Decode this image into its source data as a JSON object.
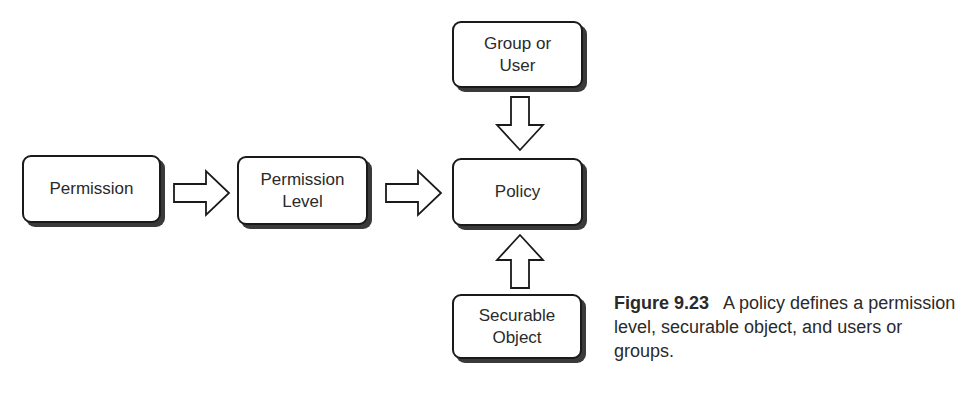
{
  "diagram": {
    "nodes": [
      {
        "id": "group-or-user",
        "label_lines": [
          "Group or",
          "User"
        ]
      },
      {
        "id": "permission",
        "label_lines": [
          "Permission"
        ]
      },
      {
        "id": "permission-level",
        "label_lines": [
          "Permission",
          "Level"
        ]
      },
      {
        "id": "policy",
        "label_lines": [
          "Policy"
        ]
      },
      {
        "id": "securable-object",
        "label_lines": [
          "Securable",
          "Object"
        ]
      }
    ],
    "edges": [
      {
        "from": "permission",
        "to": "permission-level",
        "direction": "right"
      },
      {
        "from": "permission-level",
        "to": "policy",
        "direction": "right"
      },
      {
        "from": "group-or-user",
        "to": "policy",
        "direction": "down"
      },
      {
        "from": "securable-object",
        "to": "policy",
        "direction": "up"
      }
    ]
  },
  "caption": {
    "label": "Figure 9.23",
    "text": "A policy defines a permission level, securable object, and users or groups."
  }
}
